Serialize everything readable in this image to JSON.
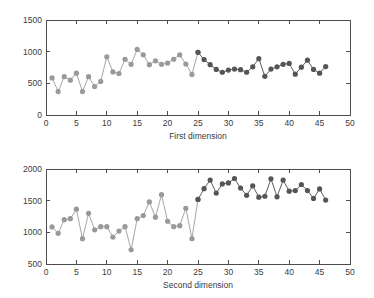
{
  "figure": {
    "background": "#ffffff",
    "axis_color": "#4d4d4d",
    "text_color": "#3c3c3c"
  },
  "chart_data": [
    {
      "type": "line",
      "id": "first-dimension",
      "title": "",
      "xlabel": "First dimension",
      "ylabel": "",
      "xlim": [
        0,
        50
      ],
      "ylim": [
        0,
        1500
      ],
      "xticks": [
        0,
        5,
        10,
        15,
        20,
        25,
        30,
        35,
        40,
        45,
        50
      ],
      "xticklabels": [
        "0",
        "5",
        "10",
        "15",
        "20",
        "25",
        "30",
        "35",
        "40",
        "45",
        "50"
      ],
      "yticks": [
        0,
        500,
        1000,
        1500
      ],
      "yticklabels": [
        "0",
        "500",
        "1000",
        "1500"
      ],
      "grid": false,
      "legend": "none",
      "marker": "circle",
      "markersize": 4.6,
      "x": [
        1,
        2,
        3,
        4,
        5,
        6,
        7,
        8,
        9,
        10,
        11,
        12,
        13,
        14,
        15,
        16,
        17,
        18,
        19,
        20,
        21,
        22,
        23,
        24,
        25,
        26,
        27,
        28,
        29,
        30,
        31,
        32,
        33,
        34,
        35,
        36,
        37,
        38,
        39,
        40,
        41,
        42,
        43,
        44,
        45,
        46
      ],
      "series": [
        {
          "name": "segment-1",
          "color": "#999999",
          "line_color": "#a6a6a6",
          "x": [
            1,
            2,
            3,
            4,
            5,
            6,
            7,
            8,
            9,
            10,
            11,
            12,
            13,
            14,
            15,
            16,
            17,
            18,
            19,
            20,
            21,
            22,
            23,
            24,
            25
          ],
          "values": [
            585,
            370,
            605,
            550,
            660,
            370,
            605,
            450,
            530,
            920,
            680,
            655,
            880,
            800,
            1035,
            950,
            795,
            855,
            800,
            820,
            880,
            950,
            805,
            640,
            990
          ]
        },
        {
          "name": "segment-2",
          "color": "#555555",
          "line_color": "#5e5e5e",
          "x": [
            25,
            26,
            27,
            28,
            29,
            30,
            31,
            32,
            33,
            34,
            35,
            36,
            37,
            38,
            39,
            40,
            41,
            42,
            43,
            44,
            45,
            46
          ],
          "values": [
            990,
            875,
            795,
            720,
            675,
            710,
            725,
            715,
            675,
            760,
            890,
            610,
            725,
            760,
            800,
            815,
            645,
            755,
            865,
            720,
            660,
            765
          ]
        }
      ]
    },
    {
      "type": "line",
      "id": "second-dimension",
      "title": "",
      "xlabel": "Second dimension",
      "ylabel": "",
      "xlim": [
        0,
        50
      ],
      "ylim": [
        500,
        2000
      ],
      "xticks": [
        0,
        5,
        10,
        15,
        20,
        25,
        30,
        35,
        40,
        45,
        50
      ],
      "xticklabels": [
        "0",
        "5",
        "10",
        "15",
        "20",
        "25",
        "30",
        "35",
        "40",
        "45",
        "50"
      ],
      "yticks": [
        500,
        1000,
        1500,
        2000
      ],
      "yticklabels": [
        "500",
        "1000",
        "1500",
        "2000"
      ],
      "grid": false,
      "legend": "none",
      "marker": "circle",
      "markersize": 4.6,
      "x": [
        1,
        2,
        3,
        4,
        5,
        6,
        7,
        8,
        9,
        10,
        11,
        12,
        13,
        14,
        15,
        16,
        17,
        18,
        19,
        20,
        21,
        22,
        23,
        24,
        25,
        26,
        27,
        28,
        29,
        30,
        31,
        32,
        33,
        34,
        35,
        36,
        37,
        38,
        39,
        40,
        41,
        42,
        43,
        44,
        45,
        46
      ],
      "series": [
        {
          "name": "segment-1",
          "color": "#999999",
          "line_color": "#a6a6a6",
          "x": [
            1,
            2,
            3,
            4,
            5,
            6,
            7,
            8,
            9,
            10,
            11,
            12,
            13,
            14,
            15,
            16,
            17,
            18,
            19,
            20,
            21,
            22,
            23,
            24,
            25
          ],
          "values": [
            1085,
            985,
            1200,
            1215,
            1365,
            900,
            1300,
            1040,
            1090,
            1090,
            925,
            1020,
            1090,
            725,
            1215,
            1265,
            1480,
            1240,
            1595,
            1175,
            1090,
            1105,
            1380,
            900,
            1520
          ]
        },
        {
          "name": "segment-2",
          "color": "#555555",
          "line_color": "#5e5e5e",
          "x": [
            25,
            26,
            27,
            28,
            29,
            30,
            31,
            32,
            33,
            34,
            35,
            36,
            37,
            38,
            39,
            40,
            41,
            42,
            43,
            44,
            45,
            46
          ],
          "values": [
            1520,
            1690,
            1825,
            1620,
            1765,
            1780,
            1850,
            1700,
            1585,
            1735,
            1555,
            1570,
            1845,
            1560,
            1825,
            1650,
            1660,
            1755,
            1660,
            1535,
            1685,
            1510
          ]
        }
      ]
    }
  ]
}
